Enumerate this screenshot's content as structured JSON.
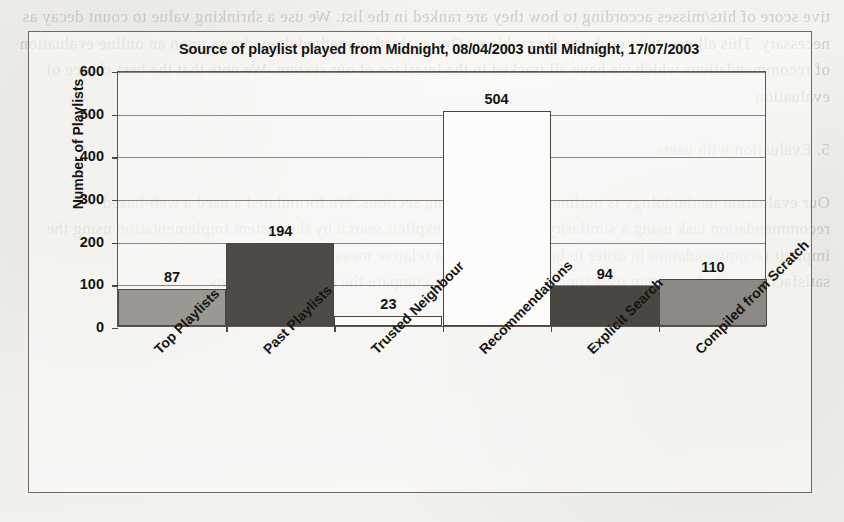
{
  "background": {
    "bleed_text": "tive score of hits/misses according to how they are ranked in the list. We use a shrinking value to count decay as necessary. This allows us to evaluate the rankings. Our evaluation methodology draws upon an online evaluation of recommendations which we have all tracked in the interface of our system. We note that the best choice of evaluation\n\n5. Evaluation with users\n\nOur evaluation methodology is outlined in the following sections. We formulated a used a web-based recommendation task using a similarity measure. The explicit search by the system implementation using the implicit recommendation in order to be able to gauge a relative measure of\nsatisfaction with the system over time. In this study we compare the recommendations"
  },
  "chart_data": {
    "type": "bar",
    "title": "Source of playlist played from Midnight, 08/04/2003 until Midnight, 17/07/2003",
    "xlabel": "",
    "ylabel": "Number of Playlists",
    "categories": [
      "Top Playlists",
      "Past Playlists",
      "Trusted Neighbour",
      "Recommendations",
      "Explicit Search",
      "Compiled from Scratch"
    ],
    "values": [
      87,
      194,
      23,
      504,
      94,
      110
    ],
    "value_labels": [
      "87",
      "194",
      "23",
      "504",
      "94",
      "110"
    ],
    "bar_colors": [
      "#9b9792",
      "#4e4b46",
      "#fbfbf8",
      "#fcfcfa",
      "#4a4742",
      "#8d8984"
    ],
    "bar_border_color": "#4a463f",
    "ylim": [
      0,
      600
    ],
    "yticks": [
      0,
      100,
      200,
      300,
      400,
      500,
      600
    ],
    "ytick_labels": [
      "0",
      "100",
      "200",
      "300",
      "400",
      "500",
      "600"
    ],
    "grid": true,
    "legend": false
  }
}
